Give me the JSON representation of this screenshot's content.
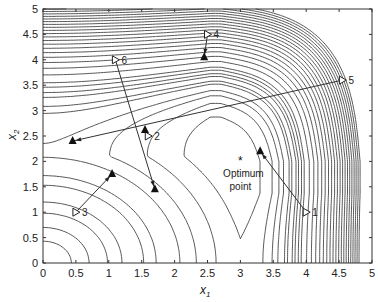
{
  "chart_data": {
    "type": "scatter",
    "title": "",
    "xlabel": "x1",
    "ylabel": "x2",
    "xlim": [
      0,
      5
    ],
    "ylim": [
      0,
      5
    ],
    "xticks": [
      "0",
      "0.5",
      "1",
      "1.5",
      "2",
      "2.5",
      "3",
      "3.5",
      "4",
      "4.5",
      "5"
    ],
    "yticks": [
      "0",
      "0.5",
      "1",
      "1.5",
      "2",
      "2.5",
      "3",
      "3.5",
      "4",
      "4.5",
      "5"
    ],
    "grid": false,
    "legend": null,
    "optimum": {
      "x": 3.0,
      "y": 2.0,
      "label_line1": "Optimum",
      "label_line2": "point",
      "marker": "*"
    },
    "trajectories": [
      {
        "id": "1",
        "start": [
          4.0,
          1.0
        ],
        "end": [
          3.3,
          2.2
        ]
      },
      {
        "id": "2",
        "start": [
          1.6,
          2.5
        ],
        "end": [
          1.55,
          2.62
        ]
      },
      {
        "id": "3",
        "start": [
          0.5,
          1.0
        ],
        "end": [
          1.05,
          1.75
        ]
      },
      {
        "id": "4",
        "start": [
          2.5,
          4.5
        ],
        "end": [
          2.45,
          4.05
        ]
      },
      {
        "id": "5",
        "start": [
          4.55,
          3.6
        ],
        "end": [
          0.45,
          2.4
        ]
      },
      {
        "id": "6",
        "start": [
          1.1,
          4.0
        ],
        "end": [
          1.7,
          1.45
        ]
      }
    ],
    "contours": "level curves of an objective with minimum near (3,2); start markers = open triangles, end markers = filled triangles"
  },
  "labels": {
    "x_main": "x",
    "x_sub": "1",
    "y_main": "x",
    "y_sub": "2"
  }
}
